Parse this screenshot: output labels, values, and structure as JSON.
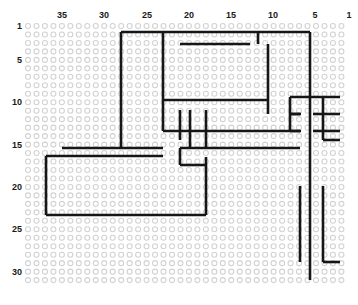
{
  "figure": {
    "kind": "grid-plot",
    "background_color": "#ffffff",
    "node_color": "#d2d2d2",
    "path_color": "#161616",
    "width": 358,
    "height": 305
  },
  "axes": {
    "top": {
      "name": "column-axis",
      "direction": "right-to-left",
      "ticks": [
        {
          "label": "35",
          "value": 35,
          "x": 62
        },
        {
          "label": "30",
          "value": 30,
          "x": 104
        },
        {
          "label": "25",
          "value": 25,
          "x": 147
        },
        {
          "label": "20",
          "value": 20,
          "x": 189
        },
        {
          "label": "15",
          "value": 15,
          "x": 231
        },
        {
          "label": "10",
          "value": 10,
          "x": 273
        },
        {
          "label": "5",
          "value": 5,
          "x": 315
        },
        {
          "label": "1",
          "value": 1,
          "x": 349
        }
      ]
    },
    "left": {
      "name": "row-axis",
      "direction": "top-to-bottom",
      "ticks": [
        {
          "label": "1",
          "value": 1,
          "y": 26
        },
        {
          "label": "5",
          "value": 5,
          "y": 60
        },
        {
          "label": "10",
          "value": 10,
          "y": 102
        },
        {
          "label": "15",
          "value": 15,
          "y": 145
        },
        {
          "label": "20",
          "value": 20,
          "y": 187
        },
        {
          "label": "25",
          "value": 25,
          "y": 229
        },
        {
          "label": "30",
          "value": 30,
          "y": 272
        }
      ]
    }
  },
  "grid": {
    "columns": 38,
    "rows": 31,
    "origin_x": 28,
    "origin_y": 26,
    "step_x": 8.47,
    "step_y": 8.47,
    "circle_radius": 2.5
  },
  "chart_data": {
    "type": "scatter",
    "title": "",
    "xlabel": "",
    "ylabel": "",
    "segments": [
      [
        121,
        32,
        310,
        32
      ],
      [
        121,
        32,
        121,
        148
      ],
      [
        163,
        32,
        163,
        100
      ],
      [
        180,
        44,
        250,
        44
      ],
      [
        258,
        44,
        258,
        32
      ],
      [
        268,
        44,
        268,
        114
      ],
      [
        310,
        32,
        310,
        280
      ],
      [
        163,
        100,
        268,
        100
      ],
      [
        163,
        100,
        163,
        131
      ],
      [
        290,
        97,
        340,
        97
      ],
      [
        290,
        97,
        290,
        131
      ],
      [
        290,
        114,
        300,
        114
      ],
      [
        323,
        97,
        323,
        140
      ],
      [
        290,
        114,
        301,
        114
      ],
      [
        313,
        114,
        340,
        114
      ],
      [
        290,
        131,
        301,
        131
      ],
      [
        313,
        131,
        340,
        131
      ],
      [
        180,
        110,
        180,
        140
      ],
      [
        190,
        110,
        190,
        148
      ],
      [
        206,
        110,
        206,
        148
      ],
      [
        163,
        131,
        300,
        131
      ],
      [
        62,
        148,
        163,
        148
      ],
      [
        180,
        148,
        300,
        148
      ],
      [
        180,
        148,
        180,
        165
      ],
      [
        180,
        165,
        206,
        165
      ],
      [
        46,
        156,
        46,
        215
      ],
      [
        46,
        156,
        163,
        156
      ],
      [
        206,
        157,
        206,
        215
      ],
      [
        46,
        215,
        206,
        215
      ],
      [
        323,
        140,
        340,
        140
      ],
      [
        300,
        186,
        300,
        262
      ],
      [
        323,
        186,
        323,
        262
      ],
      [
        323,
        262,
        340,
        262
      ]
    ]
  }
}
